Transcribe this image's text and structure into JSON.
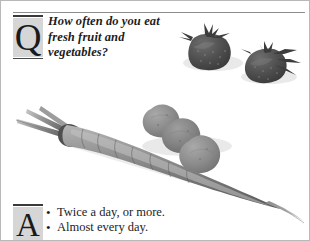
{
  "page": {
    "width": 310,
    "height": 241,
    "background_color": "#ffffff",
    "border_color": "#b8b8b8",
    "kind": "scanned-magazine-qa-panel"
  },
  "question": {
    "initial": "Q",
    "initial_background": "#d6d6d6",
    "lines": [
      "How often do you eat",
      "fresh fruit and",
      "vegetables?"
    ],
    "full_text": "How often do you eat fresh fruit and vegetables?"
  },
  "answer": {
    "initial": "A",
    "initial_background": "#d6d6d6",
    "bullet_glyph": "•",
    "options": [
      "Twice a day, or more.",
      "Almost every day."
    ]
  },
  "photo": {
    "description": "Black and white photograph of fresh vegetables and fruit",
    "subjects": [
      "carrot-with-stalk",
      "three-stacked-potatoes",
      "two-strawberries"
    ],
    "tone": "grayscale",
    "colors": {
      "vegetable_dark": "#5f5f5f",
      "vegetable_mid": "#8a8a8a",
      "vegetable_light": "#a8a8a8",
      "strawberry_dark": "#4a4a4a",
      "shadow": "#cfcfcf"
    }
  }
}
